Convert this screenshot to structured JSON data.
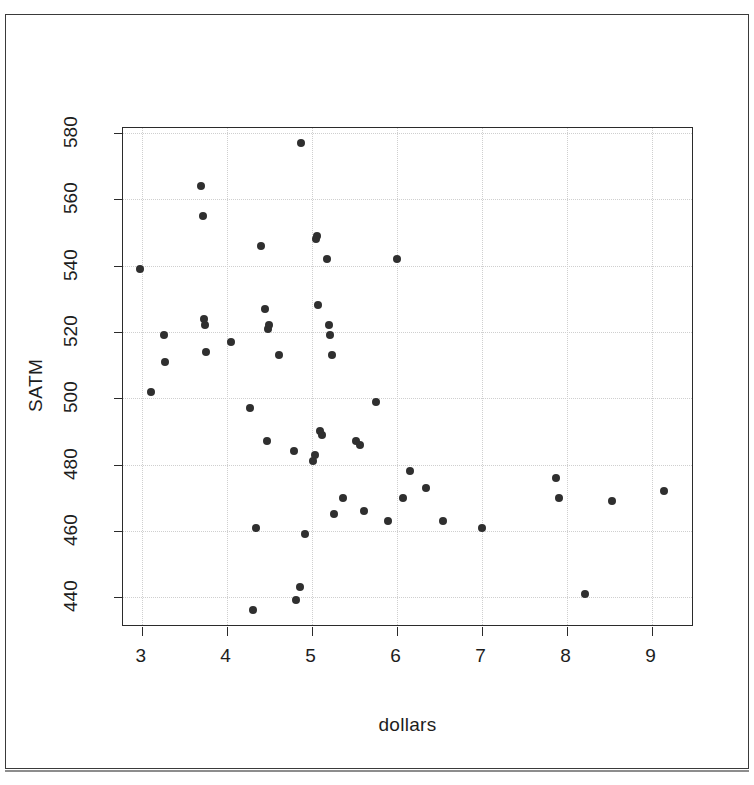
{
  "chart_data": {
    "type": "scatter",
    "title": "",
    "xlabel": "dollars",
    "ylabel": "SATM",
    "xlim": [
      2.78,
      9.5
    ],
    "ylim": [
      431.0,
      581.5
    ],
    "xticks": [
      3,
      4,
      5,
      6,
      7,
      8,
      9
    ],
    "yticks": [
      440,
      460,
      480,
      500,
      520,
      540,
      560,
      580
    ],
    "grid": true,
    "grid_style": "dotted-light",
    "legend": null,
    "point_color": "#2f2f2f",
    "point_marker": "filled-circle",
    "n_points": 50,
    "points": [
      {
        "x": 2.98,
        "y": 539
      },
      {
        "x": 3.11,
        "y": 502
      },
      {
        "x": 3.26,
        "y": 519
      },
      {
        "x": 3.28,
        "y": 511
      },
      {
        "x": 3.7,
        "y": 564
      },
      {
        "x": 3.72,
        "y": 555
      },
      {
        "x": 3.73,
        "y": 524
      },
      {
        "x": 3.75,
        "y": 522
      },
      {
        "x": 3.76,
        "y": 514
      },
      {
        "x": 4.05,
        "y": 517
      },
      {
        "x": 4.28,
        "y": 497
      },
      {
        "x": 4.31,
        "y": 436
      },
      {
        "x": 4.35,
        "y": 461
      },
      {
        "x": 4.4,
        "y": 546
      },
      {
        "x": 4.45,
        "y": 527
      },
      {
        "x": 4.47,
        "y": 487
      },
      {
        "x": 4.49,
        "y": 521
      },
      {
        "x": 4.5,
        "y": 522
      },
      {
        "x": 4.62,
        "y": 513
      },
      {
        "x": 4.79,
        "y": 484
      },
      {
        "x": 4.82,
        "y": 439
      },
      {
        "x": 4.86,
        "y": 443
      },
      {
        "x": 4.88,
        "y": 577
      },
      {
        "x": 4.92,
        "y": 459
      },
      {
        "x": 5.02,
        "y": 481
      },
      {
        "x": 5.04,
        "y": 483
      },
      {
        "x": 5.05,
        "y": 548
      },
      {
        "x": 5.06,
        "y": 549
      },
      {
        "x": 5.08,
        "y": 528
      },
      {
        "x": 5.1,
        "y": 490
      },
      {
        "x": 5.12,
        "y": 489
      },
      {
        "x": 5.18,
        "y": 542
      },
      {
        "x": 5.2,
        "y": 522
      },
      {
        "x": 5.22,
        "y": 519
      },
      {
        "x": 5.24,
        "y": 513
      },
      {
        "x": 5.26,
        "y": 465
      },
      {
        "x": 5.37,
        "y": 470
      },
      {
        "x": 5.52,
        "y": 487
      },
      {
        "x": 5.57,
        "y": 486
      },
      {
        "x": 5.62,
        "y": 466
      },
      {
        "x": 5.76,
        "y": 499
      },
      {
        "x": 5.9,
        "y": 463
      },
      {
        "x": 6.0,
        "y": 542
      },
      {
        "x": 6.07,
        "y": 470
      },
      {
        "x": 6.16,
        "y": 478
      },
      {
        "x": 6.35,
        "y": 473
      },
      {
        "x": 6.55,
        "y": 463
      },
      {
        "x": 7.0,
        "y": 461
      },
      {
        "x": 7.88,
        "y": 476
      },
      {
        "x": 7.91,
        "y": 470
      },
      {
        "x": 8.22,
        "y": 441
      },
      {
        "x": 8.53,
        "y": 469
      },
      {
        "x": 9.15,
        "y": 472
      }
    ]
  },
  "figure": {
    "background": "#ffffff",
    "frame_color": "#3a3a3a",
    "axis_color": "#2b2b2b",
    "text_color": "#1d1d1d"
  }
}
